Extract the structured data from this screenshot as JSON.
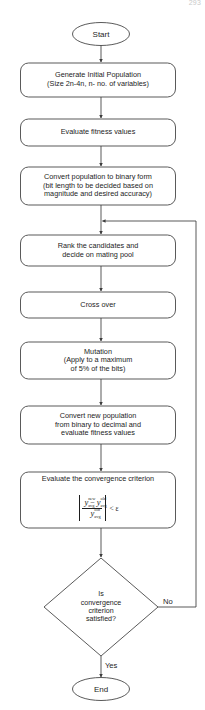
{
  "page": {
    "page_number": "293"
  },
  "colors": {
    "stroke": "#3c3c3c",
    "text": "#1d1d1d",
    "background": "#ffffff",
    "page_number": "#c9c9c9"
  },
  "nodes": {
    "start": {
      "label": "Start",
      "shape": "ellipse"
    },
    "generate": {
      "label": "Generate Initial Population\n(Size 2n-4n, n- no. of variables)",
      "shape": "rounded-rect"
    },
    "evaluate_fitness": {
      "label": "Evaluate fitness values",
      "shape": "rounded-rect"
    },
    "convert_binary": {
      "label": "Convert population to binary form\n(bit length to be decided based on\nmagnitude and desired accuracy)",
      "shape": "rounded-rect"
    },
    "rank": {
      "label": "Rank the candidates and\ndecide on mating pool",
      "shape": "rounded-rect"
    },
    "crossover": {
      "label": "Cross over",
      "shape": "rounded-rect"
    },
    "mutation": {
      "label": "Mutation\n(Apply to a maximum\nof 5% of the bits)",
      "shape": "rounded-rect"
    },
    "convert_decimal": {
      "label": "Convert new population\nfrom binary to decimal and\nevaluate fitness values",
      "shape": "rounded-rect"
    },
    "convergence": {
      "label": "Evaluate the convergence criterion",
      "shape": "rounded-rect",
      "formula": {
        "numerator_left_var": "y",
        "numerator_left_sup": "new",
        "numerator_left_sub": "avg",
        "operator": "−",
        "numerator_right_var": "y",
        "numerator_right_sup": "old",
        "numerator_right_sub": "avg",
        "denominator_var": "y",
        "denominator_sup": "old",
        "denominator_sub": "avg",
        "comparison": "< ε",
        "plain": "|(y_avg^new − y_avg^old) / y_avg^old| < ε"
      }
    },
    "decision": {
      "label": "Is\nconvergence\ncriterion\nsatisfied?",
      "shape": "diamond"
    },
    "end": {
      "label": "End",
      "shape": "ellipse"
    }
  },
  "edge_labels": {
    "no": "No",
    "yes": "Yes"
  }
}
